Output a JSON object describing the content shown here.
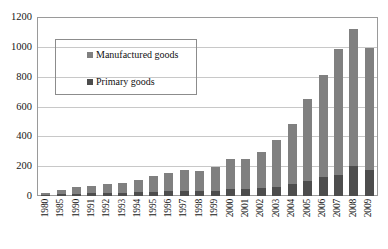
{
  "chart_data": {
    "type": "bar",
    "subtype": "stacked-column",
    "title": "",
    "xlabel": "",
    "ylabel": "",
    "ylim": [
      0,
      1200
    ],
    "ytick_step": 200,
    "ytick_labels": [
      "1200",
      "1000",
      "800",
      "600",
      "400",
      "200",
      "0"
    ],
    "grid": true,
    "grid_axis": "y",
    "legend_position": "inside-upper-left",
    "categories": [
      "1980",
      "1985",
      "1990",
      "1991",
      "1992",
      "1993",
      "1994",
      "1995",
      "1996",
      "1997",
      "1998",
      "1999",
      "2000",
      "2001",
      "2002",
      "2003",
      "2004",
      "2005",
      "2006",
      "2007",
      "2008",
      "2009"
    ],
    "series": [
      {
        "name": "Primary goods",
        "color": "#4d4d4d",
        "values": [
          8,
          12,
          16,
          18,
          20,
          22,
          25,
          29,
          33,
          36,
          34,
          37,
          48,
          48,
          51,
          63,
          82,
          103,
          126,
          145,
          206,
          176
        ]
      },
      {
        "name": "Manufactured goods",
        "color": "#808080",
        "values": [
          12,
          32,
          46,
          53,
          62,
          69,
          84,
          105,
          120,
          140,
          139,
          157,
          205,
          205,
          249,
          317,
          406,
          556,
          695,
          851,
          926,
          825
        ]
      }
    ],
    "totals": [
      20,
      44,
      62,
      71,
      82,
      91,
      109,
      134,
      153,
      176,
      173,
      194,
      253,
      253,
      300,
      380,
      488,
      659,
      821,
      996,
      1132,
      1001
    ]
  },
  "legend": {
    "items": [
      {
        "label": "Manufactured goods",
        "color": "#808080"
      },
      {
        "label": "Primary goods",
        "color": "#4d4d4d"
      }
    ]
  }
}
